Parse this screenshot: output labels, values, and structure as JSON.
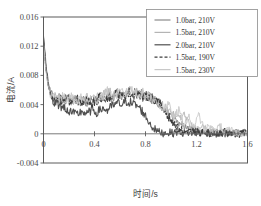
{
  "chart_data": {
    "type": "line",
    "title": "",
    "xlabel": "时间/s",
    "ylabel": "电流/A",
    "xlim": [
      0,
      1.6
    ],
    "ylim": [
      -0.004,
      0.016
    ],
    "xticks": [
      "0",
      "0.4",
      "0.8",
      "1.2",
      "1.6"
    ],
    "xtick_values": [
      0,
      0.4,
      0.8,
      1.2,
      1.6
    ],
    "yticks": [
      "-0.004",
      "0",
      "0.004",
      "0.008",
      "0.012",
      "0.016"
    ],
    "ytick_values": [
      -0.004,
      0,
      0.004,
      0.008,
      0.012,
      0.016
    ],
    "grid": false,
    "legend_position": "top-right",
    "zero_reference_line": true,
    "series": [
      {
        "name": "1.0bar, 210V",
        "color": "#8a8a8a",
        "style": "solid",
        "width": 1.0,
        "x": [
          0,
          0.02,
          0.04,
          0.06,
          0.08,
          0.1,
          0.14,
          0.18,
          0.22,
          0.26,
          0.3,
          0.34,
          0.38,
          0.42,
          0.46,
          0.5,
          0.54,
          0.58,
          0.62,
          0.66,
          0.7,
          0.74,
          0.78,
          0.82,
          0.86,
          0.9,
          0.94,
          0.98,
          1.02,
          1.06,
          1.1,
          1.14,
          1.18,
          1.22,
          1.26,
          1.3,
          1.34,
          1.38,
          1.42,
          1.46,
          1.5,
          1.54,
          1.58,
          1.6
        ],
        "y": [
          0.0131,
          0.0095,
          0.0068,
          0.0055,
          0.005,
          0.0048,
          0.005,
          0.0046,
          0.0049,
          0.0044,
          0.0047,
          0.0043,
          0.0048,
          0.0044,
          0.005,
          0.0053,
          0.0048,
          0.0055,
          0.0052,
          0.0058,
          0.0055,
          0.0059,
          0.0054,
          0.005,
          0.0047,
          0.0042,
          0.0036,
          0.0029,
          0.0022,
          0.0016,
          0.0012,
          0.0008,
          0.0005,
          0.0003,
          0.0004,
          0.0002,
          0.0003,
          0.0001,
          0.0002,
          0.0001,
          0.0002,
          0.0001,
          0.0001,
          0.0
        ]
      },
      {
        "name": "1.5bar, 210V",
        "color": "#b4b4b4",
        "style": "solid",
        "width": 0.9,
        "x": [
          0,
          0.02,
          0.04,
          0.06,
          0.08,
          0.1,
          0.14,
          0.18,
          0.22,
          0.26,
          0.3,
          0.34,
          0.38,
          0.42,
          0.46,
          0.5,
          0.54,
          0.58,
          0.62,
          0.66,
          0.7,
          0.74,
          0.78,
          0.82,
          0.86,
          0.9,
          0.94,
          0.98,
          1.02,
          1.06,
          1.1,
          1.14,
          1.18,
          1.22,
          1.26,
          1.3,
          1.34,
          1.38,
          1.42,
          1.46,
          1.5,
          1.54,
          1.58,
          1.6
        ],
        "y": [
          0.0128,
          0.0092,
          0.0066,
          0.0054,
          0.0049,
          0.0051,
          0.0047,
          0.005,
          0.0045,
          0.0048,
          0.0044,
          0.0049,
          0.0045,
          0.005,
          0.0053,
          0.006,
          0.0054,
          0.0057,
          0.0053,
          0.0059,
          0.0057,
          0.0056,
          0.0058,
          0.0052,
          0.0049,
          0.0044,
          0.0038,
          0.0033,
          0.0026,
          0.002,
          0.0026,
          0.0014,
          0.0008,
          0.0005,
          0.0009,
          0.0003,
          0.0005,
          0.0002,
          0.0003,
          0.0002,
          0.0002,
          0.0001,
          0.0001,
          0.0
        ]
      },
      {
        "name": "2.0bar, 210V",
        "color": "#4f4f4f",
        "style": "solid",
        "width": 1.1,
        "x": [
          0,
          0.02,
          0.04,
          0.06,
          0.08,
          0.1,
          0.14,
          0.18,
          0.22,
          0.26,
          0.3,
          0.34,
          0.38,
          0.42,
          0.46,
          0.5,
          0.54,
          0.58,
          0.62,
          0.66,
          0.7,
          0.74,
          0.78,
          0.82,
          0.86,
          0.9,
          0.94,
          0.98,
          1.02,
          1.06,
          1.1,
          1.14,
          1.18,
          1.22,
          1.26,
          1.3,
          1.34,
          1.38,
          1.42,
          1.46,
          1.5,
          1.54,
          1.58,
          1.6
        ],
        "y": [
          0.0133,
          0.009,
          0.0062,
          0.005,
          0.0045,
          0.0042,
          0.0038,
          0.0034,
          0.0029,
          0.0026,
          0.0031,
          0.0027,
          0.0033,
          0.0029,
          0.0035,
          0.0032,
          0.0038,
          0.0042,
          0.004,
          0.0045,
          0.0041,
          0.0038,
          0.003,
          0.0018,
          0.0008,
          0.0003,
          0.0001,
          0.0002,
          0.0001,
          0.0003,
          0.0001,
          0.0002,
          0.0001,
          0.0002,
          0.0001,
          0.0002,
          0.0,
          0.0001,
          0.0,
          0.0001,
          0.0,
          0.0001,
          0.0,
          0.0
        ]
      },
      {
        "name": "1.5bar, 190V",
        "color": "#3c3c3c",
        "style": "dashed",
        "width": 1.1,
        "x": [
          0,
          0.02,
          0.04,
          0.06,
          0.08,
          0.1,
          0.14,
          0.18,
          0.22,
          0.26,
          0.3,
          0.34,
          0.38,
          0.42,
          0.46,
          0.5,
          0.54,
          0.58,
          0.62,
          0.66,
          0.7,
          0.74,
          0.78,
          0.82,
          0.86,
          0.9,
          0.94,
          0.98,
          1.02,
          1.06,
          1.1,
          1.14,
          1.18,
          1.22,
          1.26,
          1.3,
          1.34,
          1.38,
          1.42,
          1.46,
          1.5,
          1.54,
          1.58,
          1.6
        ],
        "y": [
          0.0126,
          0.0088,
          0.0064,
          0.0053,
          0.0048,
          0.005,
          0.0046,
          0.0049,
          0.0044,
          0.0047,
          0.0043,
          0.0046,
          0.0042,
          0.0047,
          0.0051,
          0.0049,
          0.0052,
          0.0056,
          0.0051,
          0.0057,
          0.0054,
          0.0055,
          0.005,
          0.0052,
          0.0048,
          0.0043,
          0.0034,
          0.0024,
          0.0014,
          0.0007,
          0.0003,
          0.0002,
          0.0004,
          0.0001,
          0.0003,
          0.0001,
          0.0002,
          0.0001,
          0.0002,
          0.0,
          0.0001,
          0.0,
          0.0001,
          0.0
        ]
      },
      {
        "name": "1.5bar, 230V",
        "color": "#c8c8c8",
        "style": "solid",
        "width": 0.9,
        "x": [
          0,
          0.02,
          0.04,
          0.06,
          0.08,
          0.1,
          0.14,
          0.18,
          0.22,
          0.26,
          0.3,
          0.34,
          0.38,
          0.42,
          0.46,
          0.5,
          0.54,
          0.58,
          0.62,
          0.66,
          0.7,
          0.74,
          0.78,
          0.82,
          0.86,
          0.9,
          0.94,
          0.98,
          1.02,
          1.06,
          1.1,
          1.14,
          1.18,
          1.22,
          1.26,
          1.3,
          1.34,
          1.38,
          1.42,
          1.46,
          1.5,
          1.54,
          1.58,
          1.6
        ],
        "y": [
          0.0124,
          0.0086,
          0.0063,
          0.0052,
          0.005,
          0.0047,
          0.0051,
          0.0047,
          0.005,
          0.0046,
          0.0049,
          0.0045,
          0.005,
          0.0046,
          0.0052,
          0.0058,
          0.0051,
          0.0054,
          0.0058,
          0.0055,
          0.006,
          0.0054,
          0.0056,
          0.0051,
          0.0046,
          0.004,
          0.0034,
          0.004,
          0.0021,
          0.0032,
          0.0014,
          0.0022,
          0.0009,
          0.0026,
          0.0005,
          0.001,
          0.0003,
          0.0012,
          0.0002,
          0.0006,
          0.0001,
          0.0003,
          0.0001,
          0.0
        ]
      }
    ]
  },
  "legend": {
    "entries": [
      {
        "label": "1.0bar, 210V"
      },
      {
        "label": "1.5bar, 210V"
      },
      {
        "label": "2.0bar, 210V"
      },
      {
        "label": "1.5bar, 190V"
      },
      {
        "label": "1.5bar, 230V"
      }
    ]
  }
}
